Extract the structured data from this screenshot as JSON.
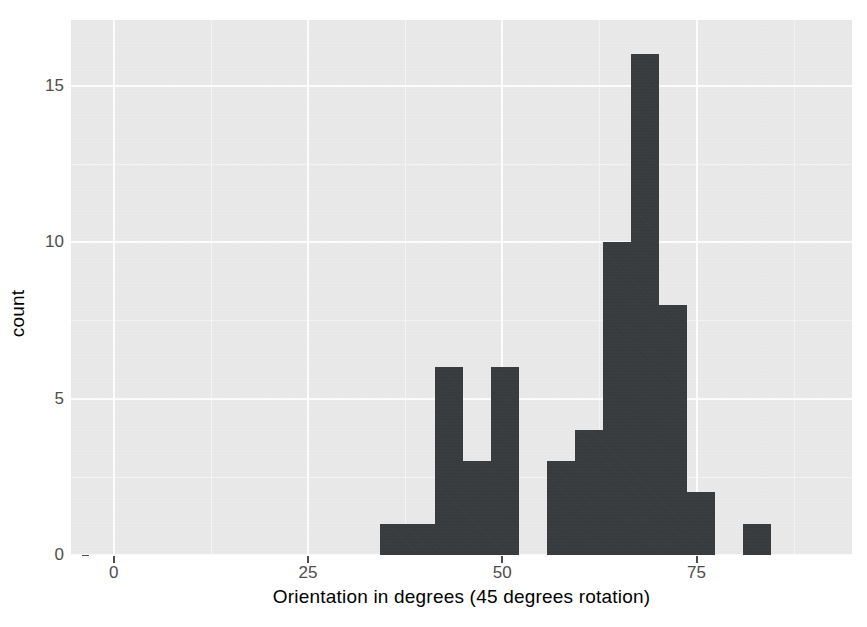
{
  "chart_data": {
    "type": "bar",
    "title": "",
    "subtitle": "",
    "xlabel": "Orientation in degrees (45 degrees rotation)",
    "ylabel": "count",
    "xlim": [
      -5.5,
      95.0
    ],
    "ylim": [
      0,
      17.1
    ],
    "grid": true,
    "legend": null,
    "bin_width": 3.6,
    "note": "Histogram of orientation measurements; bars are bin counts.",
    "x_ticks": [
      {
        "value": 0,
        "label": "0"
      },
      {
        "value": 25,
        "label": "25"
      },
      {
        "value": 50,
        "label": "50"
      },
      {
        "value": 75,
        "label": "75"
      }
    ],
    "y_ticks": [
      {
        "value": 0,
        "label": "0"
      },
      {
        "value": 5,
        "label": "5"
      },
      {
        "value": 10,
        "label": "10"
      },
      {
        "value": 15,
        "label": "15"
      }
    ],
    "x_minor_ticks": [
      12.5,
      37.5,
      62.5,
      87.5
    ],
    "y_minor_ticks": [
      2.5,
      7.5,
      12.5
    ],
    "bins": [
      {
        "x0": 34.2,
        "x1": 37.8,
        "count": 1
      },
      {
        "x0": 37.8,
        "x1": 41.4,
        "count": 1
      },
      {
        "x0": 41.4,
        "x1": 45.0,
        "count": 6
      },
      {
        "x0": 45.0,
        "x1": 48.6,
        "count": 3
      },
      {
        "x0": 48.6,
        "x1": 52.2,
        "count": 6
      },
      {
        "x0": 52.2,
        "x1": 55.8,
        "count": 0
      },
      {
        "x0": 55.8,
        "x1": 59.4,
        "count": 3
      },
      {
        "x0": 59.4,
        "x1": 63.0,
        "count": 4
      },
      {
        "x0": 63.0,
        "x1": 66.6,
        "count": 10
      },
      {
        "x0": 66.6,
        "x1": 70.2,
        "count": 16
      },
      {
        "x0": 70.2,
        "x1": 73.8,
        "count": 8
      },
      {
        "x0": 73.8,
        "x1": 77.4,
        "count": 2
      },
      {
        "x0": 77.4,
        "x1": 81.0,
        "count": 0
      },
      {
        "x0": 81.0,
        "x1": 84.6,
        "count": 1
      }
    ],
    "colors": {
      "bar": "#35393b",
      "panel_background": "#ebebeb",
      "grid_major": "#ffffff",
      "grid_minor": "#f7f7f7",
      "axis_text": "#4d4d4d",
      "title_text": "#000000",
      "figure_background": "#ffffff"
    }
  }
}
